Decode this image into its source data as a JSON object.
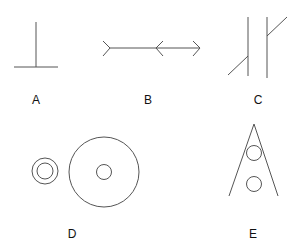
{
  "figures": [
    {
      "id": "A",
      "label": "A",
      "description": "inverted T: vertical line standing on a horizontal base"
    },
    {
      "id": "B",
      "label": "B",
      "description": "Muller-Lyer style line: fins-out segment followed by arrowheads-in/out segment"
    },
    {
      "id": "C",
      "label": "C",
      "description": "two parallel vertical lines with offset diagonal segments (Poggendorff style)"
    },
    {
      "id": "D",
      "label": "D",
      "description": "small ring of two concentric circles beside a large circle with small inner circle (Delboeuf style)"
    },
    {
      "id": "E",
      "label": "E",
      "description": "two equal circles inside converging lines (Ponzo style)"
    }
  ],
  "colors": {
    "stroke": "#555555",
    "label": "#111111",
    "background": "#ffffff"
  }
}
